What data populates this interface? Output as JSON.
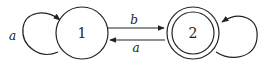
{
  "diagram": {
    "type": "finite-state-automaton",
    "states": [
      {
        "id": "1",
        "label": "1",
        "accepting": false
      },
      {
        "id": "2",
        "label": "2",
        "accepting": true
      }
    ],
    "transitions": [
      {
        "from": "1",
        "to": "1",
        "label": "a"
      },
      {
        "from": "1",
        "to": "2",
        "label": "b"
      },
      {
        "from": "2",
        "to": "1",
        "label": "a"
      },
      {
        "from": "2",
        "to": "2",
        "label": ""
      }
    ],
    "colors": {
      "stroke": "#222222",
      "background": "#ffffff"
    }
  }
}
